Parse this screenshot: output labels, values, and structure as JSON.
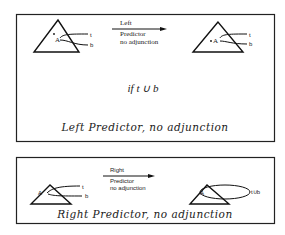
{
  "panels": [
    {
      "id": "left-predictor",
      "caption": "Left Predictor, no adjunction",
      "arrow_label": {
        "line1": "Left",
        "line2": "Predictor",
        "line3": "no adjunction"
      },
      "before": {
        "node": "A",
        "features": [
          "t",
          "b"
        ]
      },
      "after": {
        "node": "A",
        "features": [
          "t",
          "b"
        ]
      },
      "condition": "if t ∪ b"
    },
    {
      "id": "right-predictor",
      "caption": "Right Predictor, no adjunction",
      "arrow_label": {
        "line1": "Right",
        "line2": "Predictor",
        "line3": "no adjunction"
      },
      "before": {
        "node": "A",
        "features": [
          "t",
          "b"
        ]
      },
      "after": {
        "node": "A",
        "features": [
          "t∪b"
        ]
      }
    }
  ]
}
